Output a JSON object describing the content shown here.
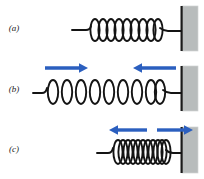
{
  "figure": {
    "type": "physics-diagram",
    "width": 204,
    "height": 179,
    "background_color": "#ffffff",
    "colors": {
      "spring_stroke": "#141414",
      "arrow_blue": "#2b5fbf",
      "wall_fill": "#b8bcbc",
      "wall_edge": "#1a1a1a",
      "label_text": "#1a1a1a"
    },
    "panels": [
      {
        "id": "a",
        "label": "(a)",
        "label_x": 14,
        "label_y": 31,
        "state": "relaxed",
        "coil_count": 9,
        "spring_start_x": 72,
        "spring_end_x": 176,
        "coil_span_x": [
          91,
          160
        ],
        "axis_y": 27,
        "lead_left_x": 72,
        "arrows": [],
        "wall": {
          "x": 182,
          "y": 6,
          "width": 16,
          "height": 45
        }
      },
      {
        "id": "b",
        "label": "(b)",
        "label_x": 14,
        "label_y": 92,
        "state": "stretched",
        "coil_count": 9,
        "spring_start_x": 33,
        "spring_end_x": 176,
        "coil_span_x": [
          46,
          163
        ],
        "axis_y": 89,
        "lead_left_x": 33,
        "arrows": [
          {
            "name": "left-arrow-right-pointing",
            "direction": "right",
            "x1": 45,
            "x2": 87,
            "y": 68
          },
          {
            "name": "right-arrow-left-pointing",
            "direction": "left",
            "x1": 176,
            "x2": 134,
            "y": 68
          }
        ],
        "wall": {
          "x": 182,
          "y": 66,
          "width": 16,
          "height": 45
        }
      },
      {
        "id": "c",
        "label": "(c)",
        "label_x": 14,
        "label_y": 152,
        "state": "compressed",
        "coil_count": 11,
        "spring_start_x": 97,
        "spring_end_x": 176,
        "coil_span_x": [
          114,
          166
        ],
        "axis_y": 152,
        "lead_left_x": 97,
        "arrows": [
          {
            "name": "left-arrow-left-pointing",
            "direction": "left",
            "x1": 147,
            "x2": 110,
            "y": 130
          },
          {
            "name": "right-arrow-right-pointing",
            "direction": "right",
            "x1": 157,
            "x2": 192,
            "y": 130
          }
        ],
        "wall": {
          "x": 182,
          "y": 127,
          "width": 16,
          "height": 46
        }
      }
    ]
  }
}
